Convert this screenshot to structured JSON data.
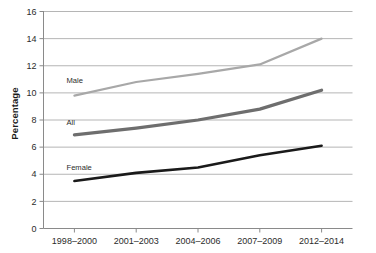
{
  "chart_data": {
    "type": "line",
    "title": "",
    "subtitle": "",
    "xlabel": "",
    "ylabel": "Percentage",
    "categories": [
      "1998–2000",
      "2001–2003",
      "2004–2006",
      "2007–2009",
      "2012–2014"
    ],
    "ylim": [
      0,
      16
    ],
    "yticks": [
      0,
      2,
      4,
      6,
      8,
      10,
      12,
      14,
      16
    ],
    "ytick_labels": [
      "0",
      "2",
      "4",
      "6",
      "8",
      "10",
      "12",
      "14",
      "16"
    ],
    "grid": true,
    "grid_axis": "y",
    "legend": "inline-labels",
    "series": [
      {
        "name": "Male",
        "values": [
          9.8,
          10.8,
          11.4,
          12.1,
          14.0
        ],
        "color": "#a8a8a8",
        "label": "Male",
        "label_x": 2001,
        "label_y": 10.7
      },
      {
        "name": "All",
        "values": [
          6.9,
          7.4,
          8.0,
          8.8,
          10.2
        ],
        "color": "#6e6e6e",
        "label": "All",
        "label_x": 2001,
        "label_y": 7.6
      },
      {
        "name": "Female",
        "values": [
          3.5,
          4.1,
          4.5,
          5.4,
          6.1
        ],
        "color": "#1a1a1a",
        "label": "Female",
        "label_x": 2001,
        "label_y": 4.3
      }
    ],
    "axis_color": "#8a8a8a",
    "grid_color": "#b5b5b5",
    "background": "#ffffff"
  },
  "yaxis": {
    "title": "Percentage"
  }
}
